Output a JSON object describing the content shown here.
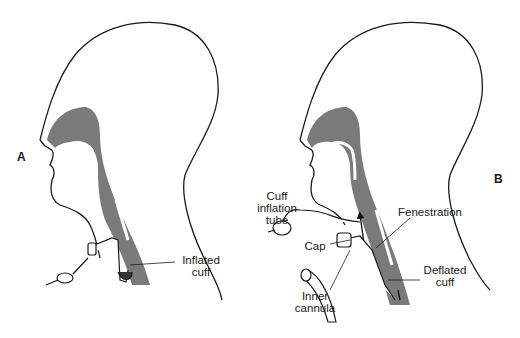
{
  "diagram": {
    "panels": [
      {
        "id": "A",
        "label": "A",
        "callouts": [
          {
            "line1": "Inflated",
            "line2": "cuff"
          }
        ]
      },
      {
        "id": "B",
        "label": "B",
        "callouts": [
          {
            "line1": "Cuff",
            "line2": "inflation",
            "line3": "tube"
          },
          {
            "line1": "Cap"
          },
          {
            "line1": "Fenestration"
          },
          {
            "line1": "Deflated",
            "line2": "cuff"
          },
          {
            "line1": "Inner",
            "line2": "cannula"
          }
        ]
      }
    ],
    "colors": {
      "airway_fill": "#7a7a7a",
      "outline": "#1a1a1a",
      "background": "#ffffff"
    }
  }
}
